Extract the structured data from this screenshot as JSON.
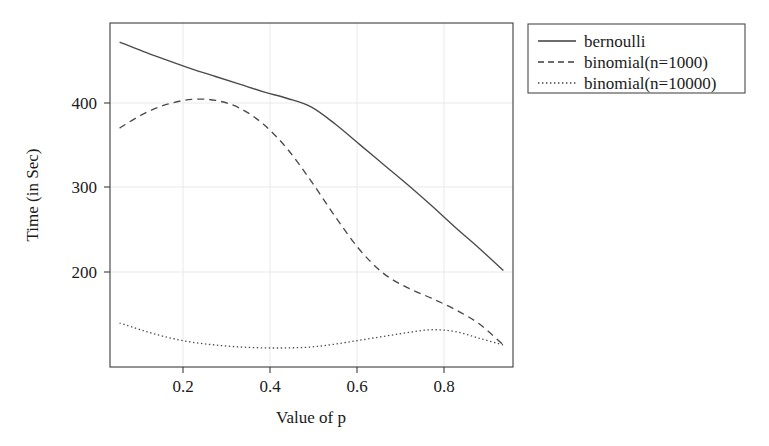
{
  "chart_data": {
    "type": "line",
    "title": "",
    "xlabel": "Value of p",
    "ylabel": "Time (in Sec)",
    "xlim": [
      0.08,
      0.92
    ],
    "ylim": [
      120,
      480
    ],
    "xticks": [
      0.2,
      0.4,
      0.6,
      0.8
    ],
    "xtick_labels": [
      "0.2",
      "0.4",
      "0.6",
      "0.8"
    ],
    "yticks": [
      200,
      300,
      400
    ],
    "ytick_labels": [
      "200",
      "300",
      "400"
    ],
    "grid": true,
    "legend_position": "outside-top-right",
    "x": [
      0.1,
      0.15,
      0.2,
      0.25,
      0.3,
      0.35,
      0.4,
      0.45,
      0.5,
      0.55,
      0.6,
      0.65,
      0.7,
      0.75,
      0.8,
      0.85,
      0.9
    ],
    "series": [
      {
        "name": "bernoulli",
        "style": "solid",
        "values": [
          460,
          450,
          441,
          432,
          424,
          416,
          408,
          401,
          392,
          374,
          353,
          332,
          311,
          289,
          266,
          244,
          221
        ]
      },
      {
        "name": "binomial(n=1000)",
        "style": "dashed",
        "values": [
          370,
          385,
          395,
          400,
          399,
          391,
          374,
          348,
          314,
          277,
          243,
          218,
          203,
          192,
          180,
          165,
          143
        ]
      },
      {
        "name": "binomial(n=10000)",
        "style": "dotted",
        "values": [
          166,
          158,
          151,
          146,
          143,
          141,
          140,
          140,
          141,
          144,
          148,
          152,
          156,
          159,
          157,
          150,
          143
        ]
      }
    ]
  },
  "axes": {
    "x_title": "Value of p",
    "y_title": "Time (in Sec)",
    "x_tick_0": "0.2",
    "x_tick_1": "0.4",
    "x_tick_2": "0.6",
    "x_tick_3": "0.8",
    "y_tick_0": "200",
    "y_tick_1": "300",
    "y_tick_2": "400"
  },
  "legend": {
    "entries": [
      {
        "label": "bernoulli",
        "style": "solid"
      },
      {
        "label": "binomial(n=1000)",
        "style": "dashed"
      },
      {
        "label": "binomial(n=10000)",
        "style": "dotted"
      }
    ]
  },
  "colors": {
    "line": "#4a4a4a",
    "frame": "#3c3c3c",
    "grid": "#e6e6e6",
    "background": "#ffffff",
    "text": "#1a1a1a"
  }
}
